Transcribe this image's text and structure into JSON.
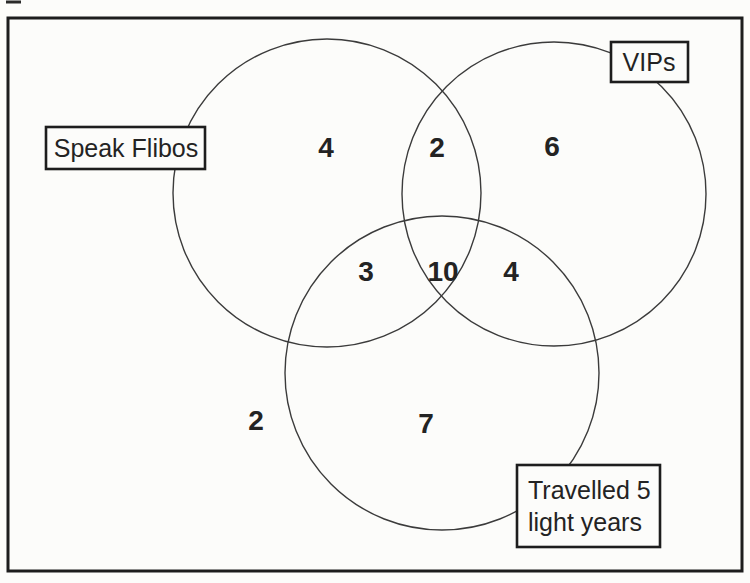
{
  "figure": {
    "type": "venn-diagram",
    "set_names": [
      "Speak Flibos",
      "VIPs",
      "Travelled 5 light years"
    ]
  },
  "labels": {
    "speak_flibos": "Speak Flibos",
    "vips": "VIPs",
    "travelled_line1": "Travelled 5",
    "travelled_line2": "light years"
  },
  "counts": {
    "speak_flibos_only": "4",
    "speak_flibos_and_vips": "2",
    "vips_only": "6",
    "speak_flibos_and_travelled": "3",
    "all_three": "10",
    "vips_and_travelled": "4",
    "travelled_only": "7",
    "outside_all": "2"
  },
  "colors": {
    "background": "#fcfcfa",
    "circle_stroke": "#3b3b3b",
    "border": "#1d1d1d",
    "text": "#232323"
  }
}
